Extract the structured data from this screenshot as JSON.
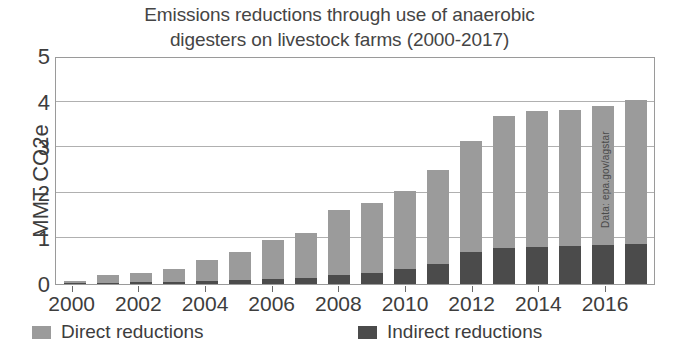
{
  "chart_data": {
    "type": "bar",
    "subtype": "stacked-column",
    "title": "Emissions reductions through use of anaerobic digesters on livestock farms (2000-2017)",
    "title_lines": [
      "Emissions reductions through use of anaerobic",
      "digesters on livestock farms (2000-2017)"
    ],
    "xlabel": "",
    "ylabel": "MMT CO2e",
    "ylim": [
      0,
      5
    ],
    "yticks": [
      0,
      1,
      2,
      3,
      4,
      5
    ],
    "ytick_labels": [
      "0",
      "1",
      "2",
      "3",
      "4",
      "5"
    ],
    "grid": true,
    "legend_position": "bottom",
    "source_note": "Data: epa.gov/agstar",
    "categories": [
      "2000",
      "2001",
      "2002",
      "2003",
      "2004",
      "2005",
      "2006",
      "2007",
      "2008",
      "2009",
      "2010",
      "2011",
      "2012",
      "2013",
      "2014",
      "2015",
      "2016",
      "2017"
    ],
    "xtick_labels": [
      "2000",
      "2002",
      "2004",
      "2006",
      "2008",
      "2010",
      "2012",
      "2014",
      "2016"
    ],
    "series": [
      {
        "name": "Indirect reductions",
        "color": "#4b4b4b",
        "values": [
          0.02,
          0.03,
          0.04,
          0.05,
          0.06,
          0.08,
          0.1,
          0.13,
          0.2,
          0.25,
          0.33,
          0.43,
          0.7,
          0.8,
          0.82,
          0.83,
          0.86,
          0.88
        ]
      },
      {
        "name": "Direct reductions",
        "color": "#9b9b9b",
        "values": [
          0.05,
          0.16,
          0.21,
          0.27,
          0.46,
          0.62,
          0.87,
          0.99,
          1.43,
          1.53,
          1.7,
          2.06,
          2.44,
          2.89,
          2.97,
          2.99,
          3.05,
          3.15
        ]
      }
    ],
    "totals": [
      0.07,
      0.19,
      0.25,
      0.32,
      0.52,
      0.7,
      0.97,
      1.12,
      1.63,
      1.78,
      2.03,
      2.49,
      3.14,
      3.69,
      3.79,
      3.82,
      3.91,
      4.03
    ]
  },
  "legend": {
    "items": [
      {
        "label": "Direct reductions",
        "color": "#9b9b9b"
      },
      {
        "label": "Indirect reductions",
        "color": "#4b4b4b"
      }
    ]
  },
  "colors": {
    "direct": "#9b9b9b",
    "indirect": "#4b4b4b",
    "axis": "#9a9a9a",
    "grid": "#b0b0b0",
    "text": "#3d3d3d",
    "background": "#ffffff"
  }
}
